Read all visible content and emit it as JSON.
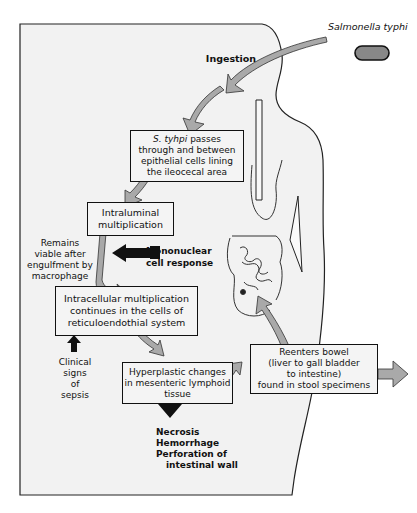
{
  "figure": {
    "organism_label": "Salmonella typhi",
    "ingestion_label": "Ingestion",
    "boxes": {
      "passage": {
        "italic_prefix": "S. tyhpi",
        "lines": [
          "passes",
          "through and between",
          "epithelial cells lining",
          "the ileocecal area"
        ]
      },
      "intraluminal": {
        "lines": [
          "Intraluminal",
          "multiplication"
        ]
      },
      "intracellular": {
        "lines": [
          "Intracellular multiplication",
          "continues in the cells of",
          "reticuloendothial system"
        ]
      },
      "hyperplastic": {
        "lines": [
          "Hyperplastic changes",
          "in mesenteric lymphoid",
          "tissue"
        ]
      },
      "reenters": {
        "lines": [
          "Reenters bowel",
          "(liver to gall bladder",
          "to intestine)",
          "found in stool specimens"
        ]
      }
    },
    "side_labels": {
      "remains_viable": [
        "Remains",
        "viable after",
        "engulfment by",
        "macrophage"
      ],
      "mononuclear": [
        "Mononuclear",
        "cell response"
      ],
      "clinical_signs": [
        "Clinical",
        "signs",
        "of",
        "sepsis"
      ],
      "outcomes": [
        "Necrosis",
        "Hemorrhage",
        "Perforation of",
        "intestinal wall"
      ]
    },
    "colors": {
      "body_fill": "#f2f2f2",
      "arrow_gray": "#a9a9a9",
      "arrow_black": "#111111",
      "box_border": "#111111"
    }
  }
}
